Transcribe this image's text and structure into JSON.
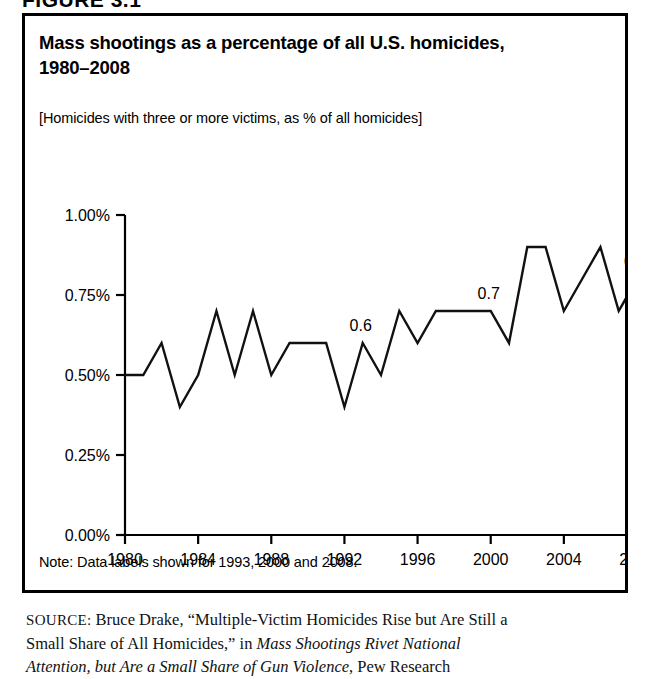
{
  "figure": {
    "header": "FIGURE 3.1"
  },
  "chart": {
    "title_line1": "Mass shootings as a percentage of all U.S. homicides,",
    "title_line2": "1980–2008",
    "subtitle": "[Homicides with three or more victims, as % of all homicides]",
    "note": "Note: Data labels shown for 1993, 2000 and 2008."
  },
  "source": {
    "label": "SOURCE:",
    "line1_a": " Bruce Drake, “Multiple-Victim Homicides Rise but Are Still a",
    "line2_a": "Small Share of All Homicides,” in ",
    "line2_italic": "Mass Shootings Rivet National",
    "line3_italic": "Attention, but Are a Small Share of Gun Violence",
    "line3_b": ", Pew Research"
  },
  "chart_data": {
    "type": "line",
    "title": "Mass shootings as a percentage of all U.S. homicides, 1980–2008",
    "subtitle": "[Homicides with three or more victims, as % of all homicides]",
    "xlabel": "",
    "ylabel": "",
    "grid": false,
    "legend": "none",
    "xlim": [
      1980,
      2008
    ],
    "ylim": [
      0,
      1.0
    ],
    "ytick_labels": [
      "0.00%",
      "0.25%",
      "0.50%",
      "0.75%",
      "1.00%"
    ],
    "ytick_values": [
      0,
      0.25,
      0.5,
      0.75,
      1.0
    ],
    "xtick_labels": [
      "1980",
      "1984",
      "1988",
      "1992",
      "1996",
      "2000",
      "2004",
      "2008"
    ],
    "xtick_values": [
      1980,
      1984,
      1988,
      1992,
      1996,
      2000,
      2004,
      2008
    ],
    "x": [
      1980,
      1981,
      1982,
      1983,
      1984,
      1985,
      1986,
      1987,
      1988,
      1989,
      1990,
      1991,
      1992,
      1993,
      1994,
      1995,
      1996,
      1997,
      1998,
      1999,
      2000,
      2001,
      2002,
      2003,
      2004,
      2005,
      2006,
      2007,
      2008
    ],
    "values": [
      0.5,
      0.5,
      0.6,
      0.4,
      0.5,
      0.7,
      0.5,
      0.7,
      0.5,
      0.6,
      0.6,
      0.6,
      0.4,
      0.6,
      0.5,
      0.7,
      0.6,
      0.7,
      0.7,
      0.7,
      0.7,
      0.6,
      0.9,
      0.9,
      0.7,
      0.8,
      0.9,
      0.7,
      0.8
    ],
    "annotations": [
      {
        "x": 1993,
        "y": 0.6,
        "text": "0.6"
      },
      {
        "x": 2000,
        "y": 0.7,
        "text": "0.7"
      },
      {
        "x": 2008,
        "y": 0.8,
        "text": "0.8"
      }
    ],
    "line_color": "#111111"
  }
}
